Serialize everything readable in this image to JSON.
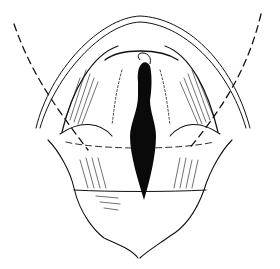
{
  "figure": {
    "style": "black ink line drawing",
    "colors": {
      "background": "#ffffff",
      "ink": "#111111",
      "fill": "#0a0a0a"
    },
    "labels": []
  }
}
